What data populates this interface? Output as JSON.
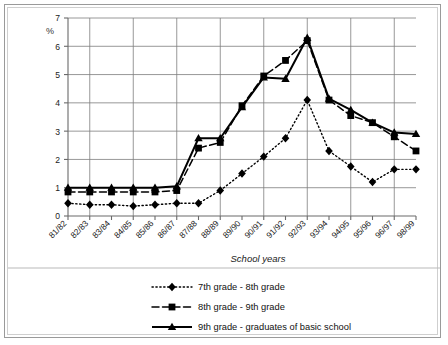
{
  "chart_data": {
    "type": "line",
    "title": "",
    "ylabel": "%",
    "xlabel": "School years",
    "ylim": [
      0,
      7
    ],
    "yticks": [
      0,
      1,
      2,
      3,
      4,
      5,
      6,
      7
    ],
    "grid": true,
    "legend_position": "bottom",
    "categories": [
      "81/82",
      "82/83",
      "83/84",
      "84/85",
      "85/86",
      "86/87",
      "87/88",
      "88/89",
      "89/90",
      "90/91",
      "91/92",
      "92/93",
      "93/94",
      "94/95",
      "95/96",
      "96/97",
      "98/99"
    ],
    "series": [
      {
        "name": "7th grade - 8th grade",
        "marker": "diamond",
        "line_style": "dotted",
        "values": [
          0.45,
          0.4,
          0.4,
          0.35,
          0.4,
          0.45,
          0.45,
          0.9,
          1.5,
          2.1,
          2.75,
          4.1,
          2.3,
          1.75,
          1.2,
          1.65,
          1.65
        ]
      },
      {
        "name": "8th grade - 9th grade",
        "marker": "square",
        "line_style": "dashed",
        "values": [
          0.85,
          0.85,
          0.85,
          0.85,
          0.85,
          0.9,
          2.4,
          2.6,
          3.9,
          4.95,
          5.5,
          6.2,
          4.1,
          3.55,
          3.3,
          2.8,
          2.3
        ]
      },
      {
        "name": "9th grade - graduates of basic school",
        "marker": "triangle",
        "line_style": "solid",
        "values": [
          1.0,
          1.0,
          1.0,
          1.0,
          1.0,
          1.05,
          2.75,
          2.75,
          3.85,
          4.9,
          4.85,
          6.3,
          4.15,
          3.75,
          3.3,
          2.95,
          2.9
        ]
      }
    ]
  },
  "colors": {
    "grid": "#7d7d7d",
    "axis": "#6a6a6a",
    "series": "#000000",
    "frame": "#9a9a9a"
  }
}
